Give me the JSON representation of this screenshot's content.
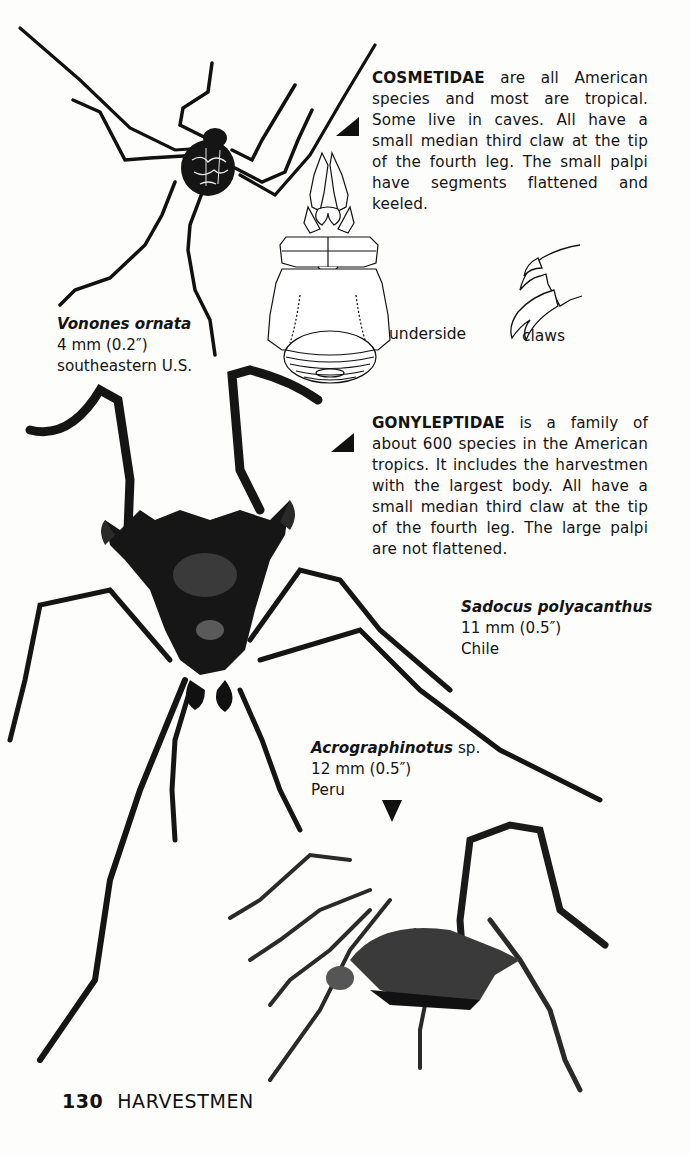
{
  "page": {
    "number": "130",
    "running_title": "HARVESTMEN"
  },
  "sections": [
    {
      "family": "COSMETIDAE",
      "text": " are all American species and most are tropical. Some live in caves. All have a small median third claw at the tip of the fourth leg. The small palpi have segments flattened and keeled."
    },
    {
      "family": "GONYLEPTIDAE",
      "text": " is a family of about 600 species in the American tropics. It includes the harvestmen with the largest body. All have a small median third claw at the tip of the fourth leg. The large palpi are not flattened."
    }
  ],
  "specimens": [
    {
      "name": "Vonones ornata",
      "qualifier": "",
      "size": "4 mm (0.2″)",
      "range": "southeastern U.S."
    },
    {
      "name": "Sadocus polyacanthus",
      "qualifier": "",
      "size": "11 mm (0.5″)",
      "range": "Chile"
    },
    {
      "name": "Acrographinotus",
      "qualifier": " sp.",
      "size": "12 mm (0.5″)",
      "range": "Peru"
    }
  ],
  "diagram_labels": {
    "underside": "underside",
    "claws": "claws"
  },
  "colors": {
    "ink": "#111111",
    "paper": "#fdfdfb"
  }
}
